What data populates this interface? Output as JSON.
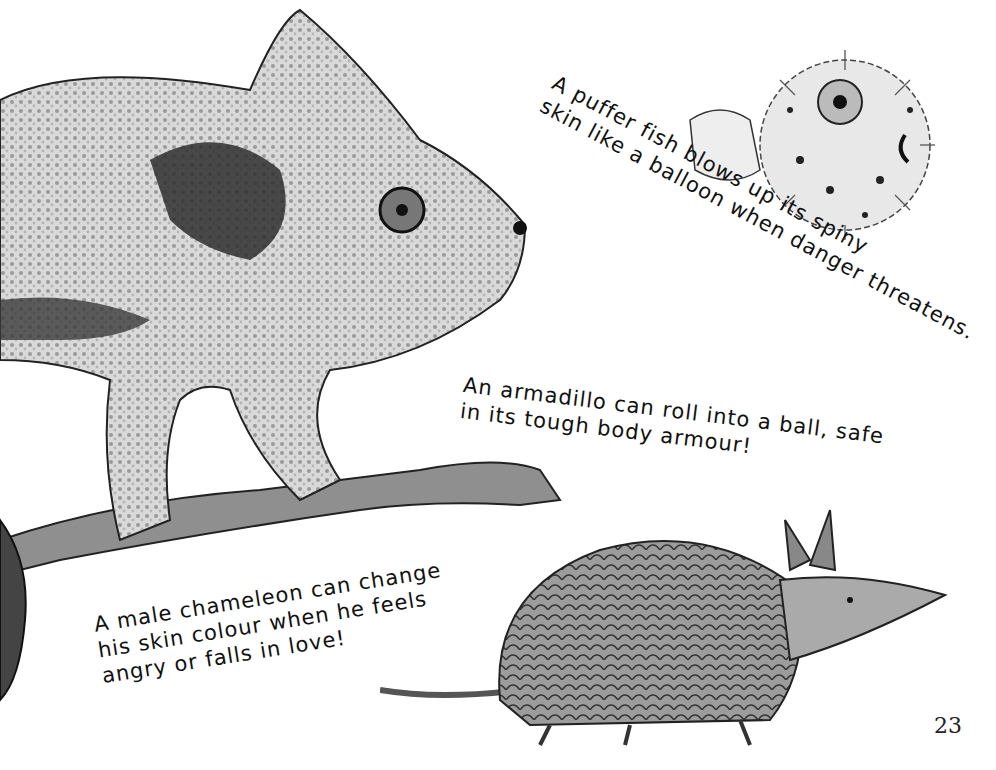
{
  "page": {
    "number": "23",
    "background": "#ffffff"
  },
  "illustrations": [
    {
      "name": "chameleon",
      "description": "Grey watercolour chameleon on a branch"
    },
    {
      "name": "puffer-fish",
      "description": "Spiny inflated puffer fish"
    },
    {
      "name": "armadillo",
      "description": "Armadillo walking"
    }
  ],
  "captions": {
    "puffer_fish": {
      "line1": "A puffer fish blows up its spiny",
      "line2": "skin like a balloon when danger threatens."
    },
    "armadillo": {
      "line1": "An armadillo can roll into a ball, safe",
      "line2": "in its tough body armour!"
    },
    "chameleon": {
      "line1": "A male chameleon can change",
      "line2": "his skin colour when he feels",
      "line3": "angry or falls in love!"
    }
  }
}
